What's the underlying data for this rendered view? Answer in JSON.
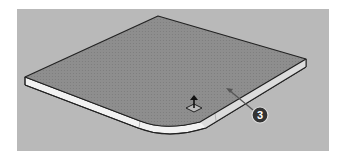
{
  "viewport": {
    "background": "#b9b9b9",
    "model": {
      "description": "Rounded-corner slab, push/pull in progress",
      "top_face_color": "#8e8e8e",
      "side_face_color": "#f2f2f2",
      "edge_color": "#222222"
    },
    "cursor": {
      "icon": "push-pull-tool-icon"
    },
    "callout": {
      "label": "3",
      "color": "#333333"
    }
  }
}
